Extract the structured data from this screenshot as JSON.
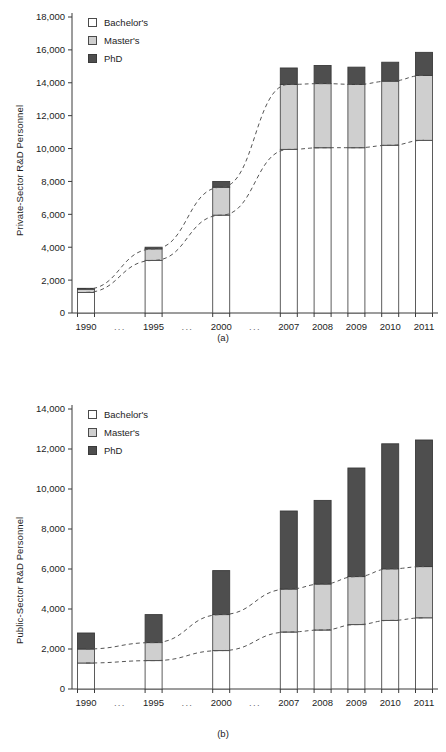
{
  "figure": {
    "panel_a_caption": "(a)",
    "panel_b_caption": "(b)"
  },
  "legend": {
    "bachelor": "Bachelor's",
    "master": "Master's",
    "phd": "PhD"
  },
  "chart_data": [
    {
      "type": "bar",
      "id": "panel-a",
      "title": "",
      "caption": "(a)",
      "stacked": true,
      "xlabel": "",
      "ylabel": "Private-Sector R&D Personnel",
      "categories": [
        "1990",
        "...",
        "1995",
        "...",
        "2000",
        "...",
        "2007",
        "2008",
        "2009",
        "2010",
        "2011"
      ],
      "bar_categories": [
        "1990",
        "1995",
        "2000",
        "2007",
        "2008",
        "2009",
        "2010",
        "2011"
      ],
      "series": [
        {
          "name": "Bachelor's",
          "color": "#ffffff",
          "values": [
            1250,
            3200,
            5950,
            9950,
            10050,
            10050,
            10200,
            10500
          ]
        },
        {
          "name": "Master's",
          "color": "#cfcfcf",
          "values": [
            200,
            700,
            1700,
            3950,
            3900,
            3850,
            3900,
            3950
          ]
        },
        {
          "name": "PhD",
          "color": "#4e4e4e",
          "values": [
            50,
            100,
            350,
            1000,
            1100,
            1050,
            1150,
            1400
          ]
        }
      ],
      "cumulative": [
        {
          "year": "1990",
          "bachelor_top": 1250,
          "master_top": 1450,
          "phd_top": 1500
        },
        {
          "year": "1995",
          "bachelor_top": 3200,
          "master_top": 3900,
          "phd_top": 4000
        },
        {
          "year": "2000",
          "bachelor_top": 5950,
          "master_top": 7650,
          "phd_top": 8000
        },
        {
          "year": "2007",
          "bachelor_top": 9950,
          "master_top": 13900,
          "phd_top": 14900
        },
        {
          "year": "2008",
          "bachelor_top": 10050,
          "master_top": 13950,
          "phd_top": 15050
        },
        {
          "year": "2009",
          "bachelor_top": 10050,
          "master_top": 13900,
          "phd_top": 14950
        },
        {
          "year": "2010",
          "bachelor_top": 10200,
          "master_top": 14100,
          "phd_top": 15250
        },
        {
          "year": "2011",
          "bachelor_top": 10500,
          "master_top": 14450,
          "phd_top": 15850
        }
      ],
      "ylim": [
        0,
        18000
      ],
      "ytick_step": 2000,
      "yticks": [
        "0",
        "2,000",
        "4,000",
        "6,000",
        "8,000",
        "10,000",
        "12,000",
        "14,000",
        "16,000",
        "18,000"
      ],
      "grid": false,
      "legend_position": "top-left",
      "trend_lines": [
        "bachelor_top",
        "master_top"
      ]
    },
    {
      "type": "bar",
      "id": "panel-b",
      "title": "",
      "caption": "(b)",
      "stacked": true,
      "xlabel": "",
      "ylabel": "Public-Sector R&D Personnel",
      "categories": [
        "1990",
        "...",
        "1995",
        "...",
        "2000",
        "...",
        "2007",
        "2008",
        "2009",
        "2010",
        "2011"
      ],
      "bar_categories": [
        "1990",
        "1995",
        "2000",
        "2007",
        "2008",
        "2009",
        "2010",
        "2011"
      ],
      "series": [
        {
          "name": "Bachelor's",
          "color": "#ffffff",
          "values": [
            1300,
            1420,
            1920,
            2850,
            2950,
            3220,
            3430,
            3560
          ]
        },
        {
          "name": "Master's",
          "color": "#cfcfcf",
          "values": [
            700,
            900,
            1800,
            2150,
            2300,
            2400,
            2580,
            2560
          ]
        },
        {
          "name": "PhD",
          "color": "#4e4e4e",
          "values": [
            800,
            1400,
            2200,
            3900,
            4180,
            5430,
            6250,
            6330
          ]
        }
      ],
      "cumulative": [
        {
          "year": "1990",
          "bachelor_top": 1300,
          "master_top": 2000,
          "phd_top": 2800
        },
        {
          "year": "1995",
          "bachelor_top": 1420,
          "master_top": 2320,
          "phd_top": 3720
        },
        {
          "year": "2000",
          "bachelor_top": 1920,
          "master_top": 3720,
          "phd_top": 5920
        },
        {
          "year": "2007",
          "bachelor_top": 2850,
          "master_top": 5000,
          "phd_top": 8900
        },
        {
          "year": "2008",
          "bachelor_top": 2950,
          "master_top": 5250,
          "phd_top": 9430
        },
        {
          "year": "2009",
          "bachelor_top": 3220,
          "master_top": 5620,
          "phd_top": 11050
        },
        {
          "year": "2010",
          "bachelor_top": 3430,
          "master_top": 6010,
          "phd_top": 12260
        },
        {
          "year": "2011",
          "bachelor_top": 3560,
          "master_top": 6120,
          "phd_top": 12450
        }
      ],
      "ylim": [
        0,
        14000
      ],
      "ytick_step": 2000,
      "yticks": [
        "0",
        "2,000",
        "4,000",
        "6,000",
        "8,000",
        "10,000",
        "12,000",
        "14,000"
      ],
      "grid": false,
      "legend_position": "top-left",
      "trend_lines": [
        "bachelor_top",
        "master_top"
      ]
    }
  ]
}
